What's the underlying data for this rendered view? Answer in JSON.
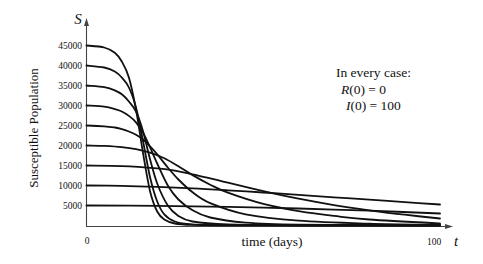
{
  "chart_data": {
    "type": "line",
    "title": "",
    "xlabel": "time (days)",
    "ylabel": "Susceptible Population",
    "x_axis_symbol": "t",
    "y_axis_symbol": "S",
    "xlim": [
      0,
      100
    ],
    "ylim": [
      0,
      50000
    ],
    "x_ticks": [
      {
        "value": 0,
        "label": "0"
      },
      {
        "value": 100,
        "label": "100"
      }
    ],
    "y_ticks": [
      {
        "value": 5000,
        "label": "5000"
      },
      {
        "value": 10000,
        "label": "10000"
      },
      {
        "value": 15000,
        "label": "15000"
      },
      {
        "value": 20000,
        "label": "20000"
      },
      {
        "value": 25000,
        "label": "25000"
      },
      {
        "value": 30000,
        "label": "30000"
      },
      {
        "value": 35000,
        "label": "35000"
      },
      {
        "value": 40000,
        "label": "40000"
      },
      {
        "value": 45000,
        "label": "45000"
      }
    ],
    "grid": false,
    "legend": null,
    "annotation": {
      "title": "In every case:",
      "lines": [
        {
          "var": "R",
          "text": "(0) = 0"
        },
        {
          "var": "I",
          "text": "(0) = 100"
        }
      ]
    },
    "series": [
      {
        "name": "S(0)=45000",
        "x": [
          0,
          5,
          8,
          10,
          12,
          14,
          16,
          18,
          20,
          22,
          25,
          30,
          40,
          60,
          100
        ],
        "values": [
          45000,
          44500,
          43200,
          41000,
          37000,
          29000,
          18000,
          8500,
          3500,
          1500,
          500,
          150,
          50,
          20,
          10
        ]
      },
      {
        "name": "S(0)=40000",
        "x": [
          0,
          5,
          8,
          10,
          12,
          14,
          16,
          18,
          20,
          22,
          25,
          30,
          40,
          60,
          100
        ],
        "values": [
          40000,
          39500,
          38500,
          37000,
          34500,
          29500,
          21000,
          12000,
          6000,
          2800,
          1000,
          300,
          80,
          30,
          15
        ]
      },
      {
        "name": "S(0)=35000",
        "x": [
          0,
          5,
          8,
          10,
          12,
          14,
          16,
          18,
          20,
          23,
          26,
          30,
          40,
          60,
          100
        ],
        "values": [
          35000,
          34600,
          33800,
          32800,
          31000,
          28500,
          23500,
          16500,
          10500,
          5000,
          2400,
          1000,
          250,
          60,
          20
        ]
      },
      {
        "name": "S(0)=30000",
        "x": [
          0,
          5,
          8,
          10,
          12,
          14,
          16,
          18,
          20,
          23,
          26,
          30,
          35,
          45,
          60,
          100
        ],
        "values": [
          30000,
          29700,
          29100,
          28500,
          27400,
          25800,
          23200,
          19500,
          15500,
          10000,
          6500,
          3800,
          2000,
          700,
          200,
          40
        ]
      },
      {
        "name": "S(0)=25000",
        "x": [
          0,
          5,
          8,
          10,
          12,
          14,
          16,
          18,
          20,
          23,
          26,
          30,
          35,
          45,
          60,
          80,
          100
        ],
        "values": [
          25000,
          24800,
          24500,
          24100,
          23500,
          22700,
          21500,
          19800,
          17800,
          14500,
          11500,
          8300,
          5600,
          2800,
          1200,
          450,
          150
        ]
      },
      {
        "name": "S(0)=20000",
        "x": [
          0,
          5,
          10,
          14,
          18,
          22,
          26,
          30,
          35,
          40,
          50,
          60,
          70,
          80,
          100
        ],
        "values": [
          20000,
          19900,
          19600,
          19100,
          18200,
          16800,
          14800,
          12600,
          10200,
          8200,
          5400,
          3600,
          2400,
          1500,
          500
        ]
      },
      {
        "name": "S(0)=15000",
        "x": [
          0,
          10,
          20,
          25,
          30,
          35,
          40,
          50,
          60,
          70,
          80,
          90,
          100
        ],
        "values": [
          15000,
          14850,
          14300,
          13700,
          12800,
          11800,
          10700,
          8600,
          6700,
          5100,
          3800,
          2700,
          1750
        ]
      },
      {
        "name": "S(0)=10000",
        "x": [
          0,
          10,
          20,
          30,
          40,
          50,
          60,
          70,
          80,
          90,
          100
        ],
        "values": [
          10000,
          9900,
          9650,
          9300,
          8800,
          8250,
          7650,
          7050,
          6450,
          5850,
          5250
        ]
      },
      {
        "name": "S(0)=5000",
        "x": [
          0,
          20,
          40,
          60,
          80,
          100
        ],
        "values": [
          5000,
          4900,
          4650,
          4250,
          3700,
          3000
        ]
      }
    ]
  }
}
